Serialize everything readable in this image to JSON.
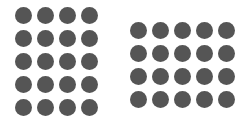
{
  "figure": {
    "background": "#ffffff",
    "dot_color": "#555555",
    "groups": [
      {
        "name": "left-grid",
        "columns": 4,
        "rows": 5,
        "count": 20
      },
      {
        "name": "right-grid",
        "columns": 5,
        "rows": 4,
        "count": 20
      }
    ]
  }
}
